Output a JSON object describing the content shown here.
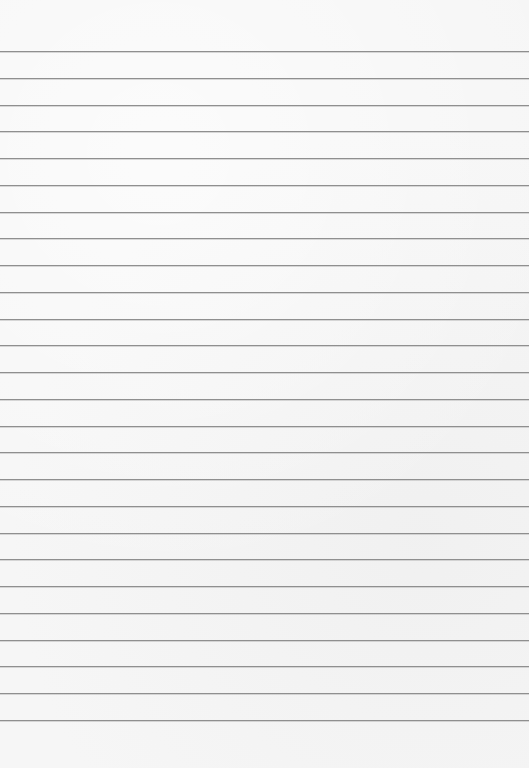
{
  "paper": {
    "width": 529,
    "height": 768,
    "background_color": "#f6f6f6",
    "rule_color": "#8f8f8f",
    "first_rule_y": 51,
    "rule_spacing": 26.76,
    "rule_count": 26
  }
}
